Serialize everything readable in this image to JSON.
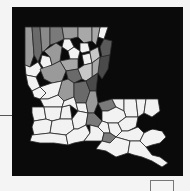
{
  "map": {
    "subject": "Louisiana parishes choropleth",
    "background_color": "#0a0a0a",
    "border_color": "#2a2a2a",
    "shade_levels": {
      "lightest": "#f2f2f2",
      "light": "#c8c8c8",
      "medium": "#9a9a9a",
      "medium_dark": "#7a7a7a",
      "dark": "#5a5a5a",
      "water": "#0a0a0a"
    },
    "regions": [
      {
        "name": "nw-1",
        "shade": "medium_dark"
      },
      {
        "name": "nw-2",
        "shade": "dark"
      },
      {
        "name": "nw-3",
        "shade": "medium"
      },
      {
        "name": "n-1",
        "shade": "medium_dark"
      },
      {
        "name": "n-2",
        "shade": "medium"
      },
      {
        "name": "n-3",
        "shade": "light"
      },
      {
        "name": "ne-1",
        "shade": "lightest"
      },
      {
        "name": "ne-2",
        "shade": "dark"
      },
      {
        "name": "ne-3",
        "shade": "medium_dark"
      },
      {
        "name": "c-1",
        "shade": "lightest"
      },
      {
        "name": "c-2",
        "shade": "lightest"
      },
      {
        "name": "c-3",
        "shade": "medium"
      },
      {
        "name": "c-4",
        "shade": "dark"
      },
      {
        "name": "c-5",
        "shade": "medium"
      },
      {
        "name": "c-6",
        "shade": "medium_dark"
      },
      {
        "name": "w-1",
        "shade": "lightest"
      },
      {
        "name": "w-2",
        "shade": "lightest"
      },
      {
        "name": "w-3",
        "shade": "lightest"
      },
      {
        "name": "sw-1",
        "shade": "lightest"
      },
      {
        "name": "sw-2",
        "shade": "lightest"
      },
      {
        "name": "s-1",
        "shade": "lightest"
      },
      {
        "name": "s-2",
        "shade": "medium"
      },
      {
        "name": "se-1",
        "shade": "lightest"
      },
      {
        "name": "se-2",
        "shade": "lightest"
      },
      {
        "name": "delta",
        "shade": "lightest"
      }
    ]
  },
  "legend": {
    "visible_text": ""
  }
}
